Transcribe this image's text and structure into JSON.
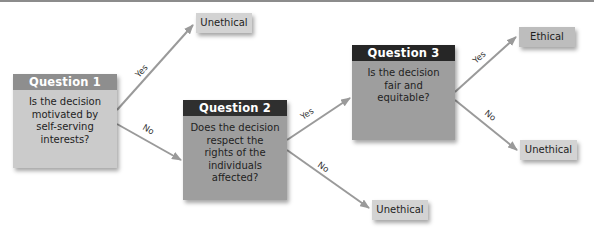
{
  "diagram": {
    "type": "decision-flowchart",
    "colors": {
      "arrow": "#9a9a9a",
      "question1_header": "#8e8e8e",
      "question1_body": "#cbcbcb",
      "question_dark_header": "#2f2f2f",
      "question_dark_body": "#9e9e9e",
      "outcome_box": "#d3d3d3"
    },
    "questions": [
      {
        "id": "q1",
        "title": "Question 1",
        "text": [
          "Is the decision",
          "motivated by",
          "self-serving",
          "interests?"
        ]
      },
      {
        "id": "q2",
        "title": "Question 2",
        "text": [
          "Does the decision",
          "respect the",
          "rights of the",
          "individuals",
          "affected?"
        ]
      },
      {
        "id": "q3",
        "title": "Question 3",
        "text": [
          "Is the decision",
          "fair and equitable?"
        ]
      }
    ],
    "outcomes": {
      "q1_yes": "Unethical",
      "q2_no": "Unethical",
      "q3_yes": "Ethical",
      "q3_no": "Unethical"
    },
    "edges": [
      {
        "from": "q1",
        "to": "q1_yes",
        "label": "Yes"
      },
      {
        "from": "q1",
        "to": "q2",
        "label": "No"
      },
      {
        "from": "q2",
        "to": "q3",
        "label": "Yes"
      },
      {
        "from": "q2",
        "to": "q2_no",
        "label": "No"
      },
      {
        "from": "q3",
        "to": "q3_yes",
        "label": "Yes"
      },
      {
        "from": "q3",
        "to": "q3_no",
        "label": "No"
      }
    ]
  }
}
